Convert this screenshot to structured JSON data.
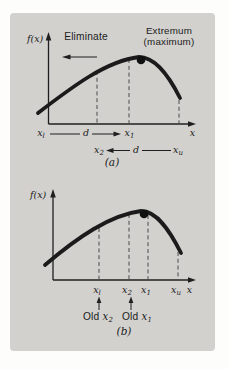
{
  "figure": {
    "colors": {
      "card_background": "#d2d1ce",
      "ink": "#1c1c1c",
      "dash": "#4a4a4a"
    },
    "panel_a": {
      "fx_label": "f(x)",
      "eliminate_label": "Eliminate",
      "extremum_label_line1": "Extremum",
      "extremum_label_line2": "(maximum)",
      "x_axis_end_label": "x",
      "row1_left": {
        "base": "x",
        "sub": "l"
      },
      "row1_d": "d",
      "row1_right": {
        "base": "x",
        "sub": "1"
      },
      "row2_left": {
        "base": "x",
        "sub": "2"
      },
      "row2_d": "d",
      "row2_right": {
        "base": "x",
        "sub": "u"
      },
      "caption": "(a)"
    },
    "panel_b": {
      "fx_label": "f(x)",
      "x_axis_end_label": "x",
      "ticks": [
        {
          "base": "x",
          "sub": "l"
        },
        {
          "base": "x",
          "sub": "2"
        },
        {
          "base": "x",
          "sub": "1"
        },
        {
          "base": "x",
          "sub": "u"
        }
      ],
      "old_x2": {
        "prefix": "Old ",
        "base": "x",
        "sub": "2"
      },
      "old_x1": {
        "prefix": "Old ",
        "base": "x",
        "sub": "1"
      },
      "caption": "(b)"
    }
  }
}
